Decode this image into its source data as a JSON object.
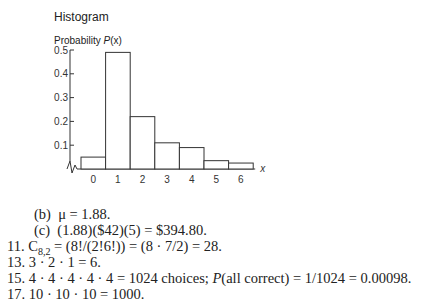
{
  "chart_data": {
    "type": "bar",
    "title": "Histogram",
    "ylabel": "Probability P(x)",
    "xlabel": "x",
    "categories": [
      "0",
      "1",
      "2",
      "3",
      "4",
      "5",
      "6"
    ],
    "values": [
      0.05,
      0.49,
      0.22,
      0.11,
      0.09,
      0.035,
      0.025
    ],
    "yticks": [
      "0.1",
      "0.2",
      "0.3",
      "0.4",
      "0.5"
    ],
    "ylim": [
      0,
      0.5
    ],
    "grid": false
  },
  "figure": {
    "title": "Histogram",
    "ylabel_prefix": "Probability ",
    "ylabel_var": "P",
    "ylabel_suffix": "(x)",
    "xlabel": "x"
  },
  "answers": {
    "b": {
      "label": "(b)",
      "text": "μ = 1.88."
    },
    "c": {
      "label": "(c)",
      "text": "(1.88)($42)(5) = $394.80."
    },
    "q11": {
      "num": "11.",
      "pre": "C",
      "sub": "8,2",
      "text": " = (8!/(2!6!)) = (8 · 7/2) = 28."
    },
    "q13": {
      "num": "13.",
      "text": "3 · 2 · 1 = 6."
    },
    "q15": {
      "num": "15.",
      "text_a": "4 · 4 · 4 · 4 · 4 = 1024 choices; ",
      "italic": "P",
      "text_b": "(all correct) = 1/1024 = 0.00098."
    },
    "q17": {
      "num": "17.",
      "text": "10 · 10 · 10 = 1000."
    }
  }
}
